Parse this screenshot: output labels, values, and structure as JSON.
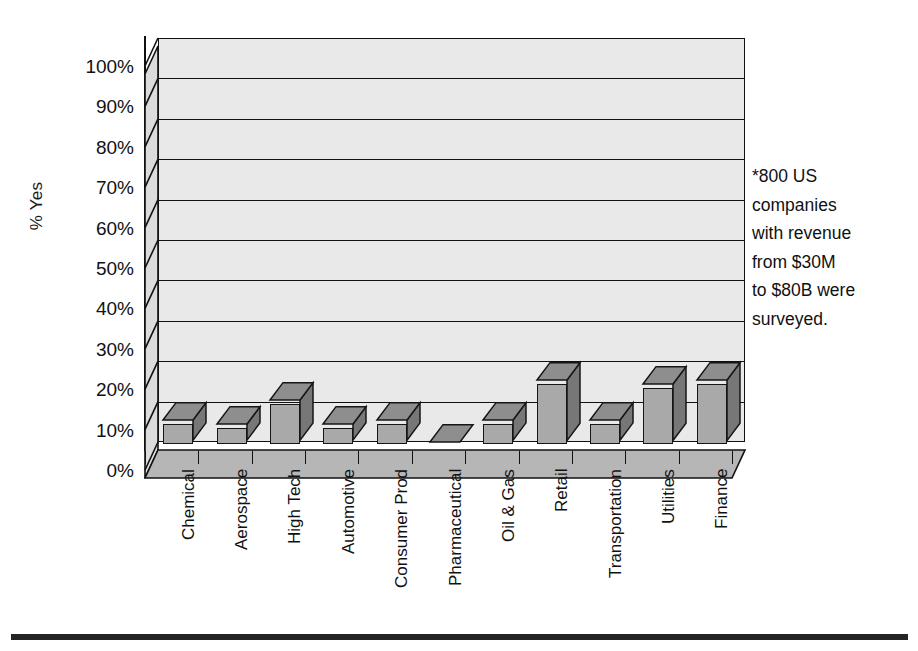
{
  "chart_data": {
    "type": "bar",
    "title": "",
    "xlabel": "",
    "ylabel": "% Yes",
    "ylim": [
      0,
      100
    ],
    "ytick_labels": [
      "100%",
      "90%",
      "80%",
      "70%",
      "60%",
      "50%",
      "40%",
      "30%",
      "20%",
      "10%",
      "0%"
    ],
    "ytick_values": [
      100,
      90,
      80,
      70,
      60,
      50,
      40,
      30,
      20,
      10,
      0
    ],
    "grid": true,
    "legend": "none",
    "style": "3d-column",
    "categories": [
      "Chemical",
      "Aerospace",
      "High Tech",
      "Automotive",
      "Consumer Prod",
      "Pharmaceutical",
      "Oil & Gas",
      "Retail",
      "Transportation",
      "Utilities",
      "Finance"
    ],
    "values": [
      5,
      4,
      10,
      4,
      5,
      0,
      5,
      15,
      5,
      14,
      15
    ],
    "annotations": [
      "*800 US companies with revenue from $30M to $80B were surveyed."
    ]
  },
  "annotation": {
    "lines": [
      "*800 US",
      "companies",
      "with revenue",
      "from $30M",
      "to $80B were",
      "surveyed."
    ]
  },
  "colors": {
    "bar_front": "#a9a9a9",
    "bar_side": "#777777",
    "bar_top": "#8e8e8e",
    "plot_background": "#e9e9e9",
    "floor": "#b6b6b6",
    "axis": "#111111",
    "text": "#1a1a1a",
    "rule": "#242424"
  }
}
